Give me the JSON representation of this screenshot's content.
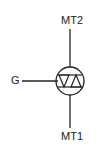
{
  "diagram": {
    "labels": {
      "mt2": "MT2",
      "mt1": "MT1",
      "gate": "G"
    },
    "stroke_color": "#222222"
  }
}
